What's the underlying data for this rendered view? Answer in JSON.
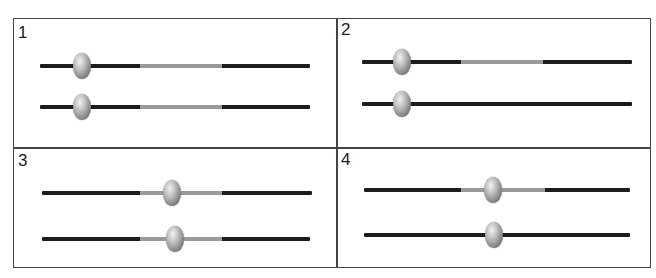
{
  "colors": {
    "border": "#444444",
    "track": "#1c1c1c",
    "range_segment": "#9a9a9a",
    "thumb": "#8a8a8a"
  },
  "panels": [
    {
      "label": "1",
      "sliders": [
        {
          "track": [
            40,
            310
          ],
          "y": 66,
          "range": [
            140,
            222
          ],
          "thumb_x": 82
        },
        {
          "track": [
            40,
            310
          ],
          "y": 107,
          "range": [
            140,
            222
          ],
          "thumb_x": 82
        }
      ]
    },
    {
      "label": "2",
      "sliders": [
        {
          "track": [
            362,
            632
          ],
          "y": 62,
          "range": [
            461,
            543
          ],
          "thumb_x": 402
        },
        {
          "track": [
            362,
            632
          ],
          "y": 104,
          "range": null,
          "thumb_x": 402
        }
      ]
    },
    {
      "label": "3",
      "sliders": [
        {
          "track": [
            42,
            312
          ],
          "y": 193,
          "range": [
            140,
            222
          ],
          "thumb_x": 172
        },
        {
          "track": [
            42,
            310
          ],
          "y": 239,
          "range": [
            140,
            222
          ],
          "thumb_x": 175
        }
      ]
    },
    {
      "label": "4",
      "sliders": [
        {
          "track": [
            364,
            630
          ],
          "y": 190,
          "range": [
            461,
            545
          ],
          "thumb_x": 493
        },
        {
          "track": [
            364,
            630
          ],
          "y": 235,
          "range": null,
          "thumb_x": 494
        }
      ]
    }
  ]
}
